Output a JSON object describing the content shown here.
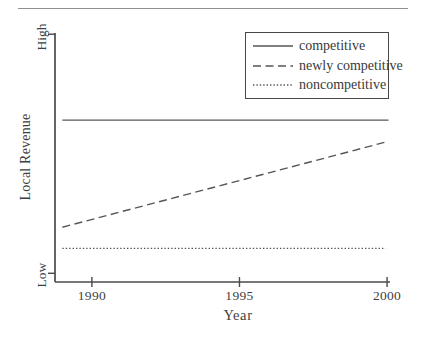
{
  "figure": {
    "top_rule": true,
    "colors": {
      "axis": "#4a4a4a",
      "line": "#565656",
      "text": "#3f3f3f",
      "rule": "#8f8f8f",
      "background": "#ffffff"
    }
  },
  "chart_data": {
    "type": "line",
    "title": "",
    "xlabel": "Year",
    "ylabel": "Local Revenue",
    "xlim": [
      1988.75,
      2000.1
    ],
    "ylim": [
      0,
      1
    ],
    "grid": false,
    "legend_position": "top-right",
    "xticks": [
      "1990",
      "1995",
      "2000"
    ],
    "yticks": [
      {
        "label": "High",
        "value": 0.995
      },
      {
        "label": "Low",
        "value": 0.035
      }
    ],
    "series": [
      {
        "name": "competitive",
        "line_style": "solid",
        "x": [
          1989,
          2000.05
        ],
        "values": [
          0.65,
          0.65
        ]
      },
      {
        "name": "newly competitive",
        "line_style": "dashed",
        "x": [
          1989,
          2000.05
        ],
        "values": [
          0.22,
          0.565
        ]
      },
      {
        "name": "noncompetitive",
        "line_style": "dotted",
        "x": [
          1989,
          1999.95
        ],
        "values": [
          0.135,
          0.135
        ]
      }
    ]
  }
}
